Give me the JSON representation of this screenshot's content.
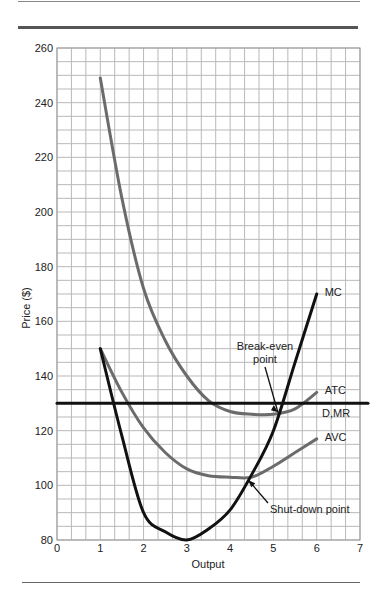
{
  "chart_data": {
    "type": "line",
    "title": "",
    "xlabel": "Output",
    "ylabel": "Price ($)",
    "xlim": [
      0,
      7
    ],
    "ylim": [
      80,
      260
    ],
    "x_ticks": [
      "0",
      "1",
      "2",
      "3",
      "4",
      "5",
      "6",
      "7"
    ],
    "y_ticks": [
      "80",
      "100",
      "120",
      "140",
      "160",
      "180",
      "200",
      "220",
      "240",
      "260"
    ],
    "grid": true,
    "grid_minor_x_step": 0.3333,
    "grid_minor_y_step": 5,
    "series": [
      {
        "name": "ATC",
        "color": "#6b6b6b",
        "x": [
          1,
          1.5,
          2,
          2.5,
          3,
          3.5,
          4,
          4.5,
          5,
          5.5,
          6
        ],
        "values": [
          249,
          205,
          172,
          153,
          140,
          131,
          127,
          126,
          126,
          128,
          134
        ]
      },
      {
        "name": "AVC",
        "color": "#6b6b6b",
        "x": [
          1,
          1.5,
          2,
          2.5,
          3,
          3.5,
          4,
          4.5,
          5,
          5.5,
          6
        ],
        "values": [
          150,
          134,
          121,
          112,
          106,
          103.5,
          103,
          103,
          107,
          112,
          117
        ]
      },
      {
        "name": "MC",
        "color": "#111111",
        "x": [
          1,
          1.5,
          2,
          2.5,
          3,
          3.5,
          4,
          4.5,
          5,
          5.5,
          6
        ],
        "values": [
          150,
          118,
          90,
          83,
          80,
          84,
          91,
          104,
          120,
          145,
          170
        ]
      },
      {
        "name": "D,MR",
        "color": "#111111",
        "x": [
          0,
          7
        ],
        "values": [
          130,
          130
        ]
      }
    ],
    "annotations": [
      {
        "text_lines": [
          "Break-even",
          "point"
        ],
        "points_to": [
          5.15,
          126
        ]
      },
      {
        "text_lines": [
          "Shut-down point"
        ],
        "points_to": [
          4.35,
          103
        ]
      }
    ],
    "legend": "inline labels at curve ends"
  }
}
